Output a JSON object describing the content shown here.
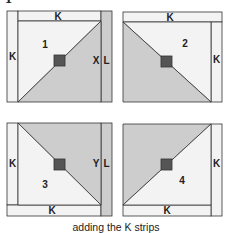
{
  "figure_number": "1",
  "caption": "adding the K strips",
  "colors": {
    "light_fill": "#f3f3f3",
    "dark_fill": "#cdcdcd",
    "center_square": "#555555",
    "outline": "#333333"
  },
  "blocks": [
    {
      "number": "1",
      "strips": {
        "top": "K",
        "left": "K",
        "inner_right": "X",
        "outer_right": "L"
      }
    },
    {
      "number": "2",
      "strips": {
        "top": "K",
        "right": "K"
      }
    },
    {
      "number": "3",
      "strips": {
        "left": "K",
        "bottom": "K",
        "inner_right": "Y",
        "outer_right": "L"
      }
    },
    {
      "number": "4",
      "strips": {
        "right": "K",
        "bottom": "K"
      }
    }
  ]
}
